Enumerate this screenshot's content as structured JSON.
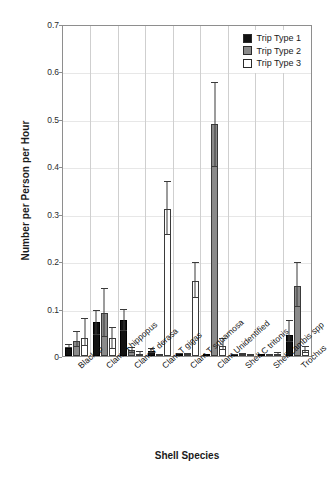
{
  "chart_data": {
    "type": "bar",
    "title": "",
    "xlabel": "Shell Species",
    "ylabel": "Number per Person per Hour",
    "ylim": [
      0,
      0.7
    ],
    "yticks": [
      "0",
      "0.1",
      "0.2",
      "0.3",
      "0.4",
      "0.5",
      "0.6",
      "0.7"
    ],
    "grid": true,
    "legend_position": "top-right",
    "categories": [
      "Blacklip",
      "Clam H hippopus",
      "Clam T derasa",
      "Clam T gigas",
      "Clam T squamosa",
      "Clam Unidentified",
      "Shell C tritonis",
      "Shell Lambis spp",
      "Trochus"
    ],
    "series": [
      {
        "name": "Trip Type 1",
        "color": "#121212",
        "values": [
          0.017,
          0.071,
          0.075,
          0.011,
          0.005,
          0.0,
          0.003,
          0.0,
          0.045
        ],
        "err_low": [
          0.017,
          0.045,
          0.052,
          0.007,
          0.004,
          0.0,
          0.002,
          0.0,
          0.03
        ],
        "err_high": [
          0.026,
          0.098,
          0.099,
          0.016,
          0.007,
          0.0,
          0.004,
          0.0,
          0.076
        ]
      },
      {
        "name": "Trip Type 2",
        "color": "#8a8a8a",
        "values": [
          0.031,
          0.091,
          0.012,
          0.002,
          0.004,
          0.489,
          0.004,
          0.002,
          0.148
        ],
        "err_low": [
          0.019,
          0.041,
          0.007,
          0.001,
          0.002,
          0.398,
          0.002,
          0.001,
          0.103
        ],
        "err_high": [
          0.052,
          0.144,
          0.019,
          0.004,
          0.007,
          0.578,
          0.006,
          0.004,
          0.199
        ]
      },
      {
        "name": "Trip Type 3",
        "color": "#ffffff",
        "values": [
          0.038,
          0.037,
          0.005,
          0.31,
          0.158,
          0.021,
          0.0,
          0.004,
          0.012
        ],
        "err_low": [
          0.021,
          0.015,
          0.002,
          0.255,
          0.122,
          0.013,
          0.0,
          0.002,
          0.006
        ],
        "err_high": [
          0.08,
          0.062,
          0.01,
          0.37,
          0.199,
          0.039,
          0.0,
          0.008,
          0.021
        ]
      }
    ]
  },
  "legend": {
    "items": [
      {
        "label": "Trip Type 1"
      },
      {
        "label": "Trip Type 2"
      },
      {
        "label": "Trip Type 3"
      }
    ]
  }
}
